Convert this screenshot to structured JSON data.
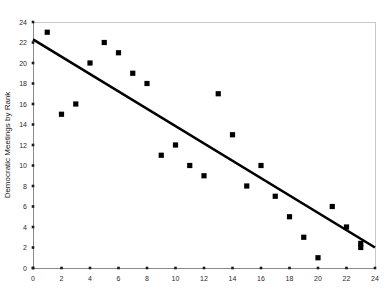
{
  "chart_data": {
    "type": "scatter",
    "title": "",
    "xlabel": "",
    "ylabel": "Democratic Meetings by Rank",
    "xlim": [
      0,
      24
    ],
    "ylim": [
      0,
      24
    ],
    "grid": false,
    "legend": false,
    "x_ticks": [
      0,
      2,
      4,
      6,
      8,
      10,
      12,
      14,
      16,
      18,
      20,
      22,
      24
    ],
    "y_ticks": [
      0,
      2,
      4,
      6,
      8,
      10,
      12,
      14,
      16,
      18,
      20,
      22,
      24
    ],
    "x_tick_labels": [
      "0",
      "2",
      "4",
      "6",
      "8",
      "10",
      "12",
      "14",
      "16",
      "18",
      "20",
      "22",
      "24"
    ],
    "y_tick_labels": [
      "0",
      "2",
      "4",
      "6",
      "8",
      "10",
      "12",
      "14",
      "16",
      "18",
      "20",
      "22",
      "24"
    ],
    "marker": "square",
    "marker_color": "#000000",
    "series": [
      {
        "name": "Democratic Meetings by Rank",
        "points": [
          [
            1,
            23
          ],
          [
            2,
            15
          ],
          [
            3,
            16
          ],
          [
            4,
            20
          ],
          [
            5,
            22
          ],
          [
            6,
            21
          ],
          [
            7,
            19
          ],
          [
            8,
            18
          ],
          [
            9,
            11
          ],
          [
            10,
            12
          ],
          [
            11,
            10
          ],
          [
            12,
            9
          ],
          [
            13,
            17
          ],
          [
            14,
            13
          ],
          [
            15,
            8
          ],
          [
            16,
            10
          ],
          [
            17,
            7
          ],
          [
            18,
            5
          ],
          [
            19,
            3
          ],
          [
            20,
            1
          ],
          [
            21,
            6
          ],
          [
            22,
            4
          ],
          [
            23,
            2
          ],
          [
            23,
            2.4
          ]
        ]
      }
    ],
    "trend_line": {
      "x_start": 0,
      "y_start": 22.3,
      "x_end": 24,
      "y_end": 2.0,
      "color": "#000000"
    }
  }
}
